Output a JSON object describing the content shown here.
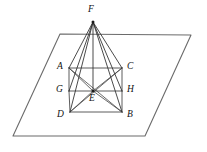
{
  "figure": {
    "canvas": {
      "width": 207,
      "height": 152
    },
    "colors": {
      "background": "#ffffff",
      "plane_stroke": "#6b6b6b",
      "solid_stroke": "#2b2b2b",
      "inner_stroke": "#333333",
      "diagonal_stroke": "#3a3a3a",
      "label_color": "#111111"
    },
    "plane": {
      "name": "base-plane",
      "points": "60,34 191,35 145,136 13,136"
    },
    "vertices": [
      {
        "id": "F",
        "label": "F",
        "x": 93,
        "y": 22,
        "label_x": 88,
        "label_y": 5,
        "dot": true
      },
      {
        "id": "A",
        "label": "A",
        "x": 69,
        "y": 68,
        "label_x": 57,
        "label_y": 62,
        "dot": false
      },
      {
        "id": "C",
        "label": "C",
        "x": 122,
        "y": 68,
        "label_x": 127,
        "label_y": 62,
        "dot": false
      },
      {
        "id": "G",
        "label": "G",
        "x": 69,
        "y": 91,
        "label_x": 56,
        "label_y": 85,
        "dot": false
      },
      {
        "id": "H",
        "label": "H",
        "x": 122,
        "y": 91,
        "label_x": 127,
        "label_y": 85,
        "dot": false
      },
      {
        "id": "E",
        "label": "E",
        "x": 93,
        "y": 91,
        "label_x": 89,
        "label_y": 94,
        "dot": true
      },
      {
        "id": "D",
        "label": "D",
        "x": 70,
        "y": 112,
        "label_x": 57,
        "label_y": 110,
        "dot": false
      },
      {
        "id": "B",
        "label": "B",
        "x": 122,
        "y": 112,
        "label_x": 127,
        "label_y": 110,
        "dot": false
      }
    ],
    "edges": [
      {
        "name": "edge-F-A",
        "from": "F",
        "to": "A",
        "style": "solid-edge"
      },
      {
        "name": "edge-F-C",
        "from": "F",
        "to": "C",
        "style": "solid-edge"
      },
      {
        "name": "edge-F-D",
        "from": "F",
        "to": "D",
        "style": "solid-edge"
      },
      {
        "name": "edge-F-B",
        "from": "F",
        "to": "B",
        "style": "solid-edge"
      },
      {
        "name": "edge-F-G",
        "from": "F",
        "to": "G",
        "style": "solid-edge"
      },
      {
        "name": "edge-F-H",
        "from": "F",
        "to": "H",
        "style": "solid-edge"
      },
      {
        "name": "edge-F-E",
        "from": "F",
        "to": "E",
        "style": "solid-edge"
      },
      {
        "name": "edge-A-G",
        "from": "A",
        "to": "G",
        "style": "inner-edge"
      },
      {
        "name": "edge-G-D",
        "from": "G",
        "to": "D",
        "style": "inner-edge"
      },
      {
        "name": "edge-C-H",
        "from": "C",
        "to": "H",
        "style": "inner-edge"
      },
      {
        "name": "edge-H-B",
        "from": "H",
        "to": "B",
        "style": "inner-edge"
      },
      {
        "name": "edge-G-H",
        "from": "G",
        "to": "H",
        "style": "inner-edge"
      },
      {
        "name": "edge-D-B",
        "from": "D",
        "to": "B",
        "style": "inner-edge"
      },
      {
        "name": "edge-A-C",
        "from": "A",
        "to": "C",
        "style": "inner-edge"
      },
      {
        "name": "edge-A-E",
        "from": "A",
        "to": "E",
        "style": "diagonal-edge"
      },
      {
        "name": "edge-C-E",
        "from": "C",
        "to": "E",
        "style": "diagonal-edge"
      },
      {
        "name": "edge-D-E",
        "from": "D",
        "to": "E",
        "style": "diagonal-edge"
      },
      {
        "name": "edge-B-E",
        "from": "B",
        "to": "E",
        "style": "diagonal-edge"
      },
      {
        "name": "edge-A-B",
        "from": "A",
        "to": "B",
        "style": "diagonal-edge"
      },
      {
        "name": "edge-C-D",
        "from": "C",
        "to": "D",
        "style": "diagonal-edge"
      }
    ]
  }
}
